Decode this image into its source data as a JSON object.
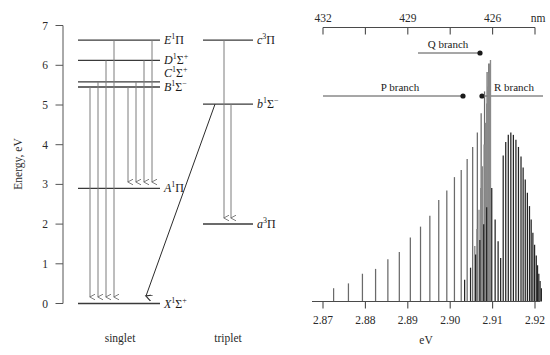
{
  "figure": {
    "type": "two-panel-scientific-figure"
  },
  "left_panel": {
    "name": "energy-level-diagram",
    "y_axis": {
      "label": "Energy, eV",
      "ticks": [
        "0",
        "1",
        "2",
        "3",
        "4",
        "5",
        "6",
        "7"
      ],
      "min": 0,
      "max": 7,
      "unit": "eV"
    },
    "column_captions": [
      "singlet",
      "triplet"
    ],
    "levels": [
      {
        "id": "X",
        "letter": "X",
        "multiplicity": "1",
        "term": "Σ",
        "charge": "+",
        "energy": 0.0,
        "column": "singlet"
      },
      {
        "id": "A",
        "letter": "A",
        "multiplicity": "1",
        "term": "Π",
        "charge": "",
        "energy": 2.9,
        "column": "singlet"
      },
      {
        "id": "B",
        "letter": "B",
        "multiplicity": "1",
        "term": "Σ",
        "charge": "−",
        "energy": 5.45,
        "column": "singlet"
      },
      {
        "id": "C",
        "letter": "C",
        "multiplicity": "1",
        "term": "Σ",
        "charge": "+",
        "energy": 5.58,
        "column": "singlet"
      },
      {
        "id": "D",
        "letter": "D",
        "multiplicity": "1",
        "term": "Σ",
        "charge": "+",
        "energy": 6.12,
        "column": "singlet"
      },
      {
        "id": "E",
        "letter": "E",
        "multiplicity": "1",
        "term": "Π",
        "charge": "",
        "energy": 6.63,
        "column": "singlet"
      },
      {
        "id": "a",
        "letter": "a",
        "multiplicity": "3",
        "term": "Π",
        "charge": "",
        "energy": 2.03,
        "column": "triplet"
      },
      {
        "id": "b",
        "letter": "b",
        "multiplicity": "1",
        "term": "Σ",
        "charge": "−",
        "energy": 5.02,
        "column": "triplet"
      },
      {
        "id": "c",
        "letter": "c",
        "multiplicity": "3",
        "term": "Π",
        "charge": "",
        "energy": 6.63,
        "column": "triplet"
      }
    ],
    "transitions": [
      {
        "from": "E",
        "to": "X",
        "kind": "vertical"
      },
      {
        "from": "D",
        "to": "X",
        "kind": "vertical"
      },
      {
        "from": "C",
        "to": "X",
        "kind": "vertical"
      },
      {
        "from": "B",
        "to": "X",
        "kind": "vertical"
      },
      {
        "from": "E",
        "to": "A",
        "kind": "vertical"
      },
      {
        "from": "D",
        "to": "A",
        "kind": "vertical"
      },
      {
        "from": "C",
        "to": "A",
        "kind": "vertical"
      },
      {
        "from": "B",
        "to": "A",
        "kind": "vertical"
      },
      {
        "from": "c",
        "to": "a",
        "kind": "vertical"
      },
      {
        "from": "b",
        "to": "a",
        "kind": "vertical"
      },
      {
        "from": "b",
        "to": "X",
        "kind": "diagonal-intercombination"
      }
    ]
  },
  "right_panel": {
    "name": "rotational-spectrum",
    "top_axis": {
      "label": "nm",
      "tick_labels": [
        "432",
        "",
        "429",
        "",
        "426",
        ""
      ],
      "values": [
        432,
        430.5,
        429,
        427.5,
        426,
        424.5
      ]
    },
    "bottom_axis": {
      "label": "eV",
      "tick_labels": [
        "2.87",
        "2.88",
        "2.89",
        "2.90",
        "2.91",
        "2.92"
      ],
      "min": 2.865,
      "max": 2.9265
    },
    "annotations": [
      {
        "id": "q-branch",
        "label": "Q branch"
      },
      {
        "id": "p-branch",
        "label": "P branch"
      },
      {
        "id": "r-branch",
        "label": "R branch"
      }
    ]
  },
  "chart_data": {
    "type": "bar",
    "title": "",
    "xlabel": "eV",
    "ylabel": "",
    "xlim": [
      2.865,
      2.9265
    ],
    "ylim": [
      0,
      1
    ],
    "grid": false,
    "secondary_xaxis": {
      "label": "nm",
      "ticks": [
        432,
        429,
        426
      ]
    },
    "legend_position": "inline-annotations",
    "series": [
      {
        "name": "P branch",
        "x": [
          2.8725,
          2.876,
          2.8793,
          2.8824,
          2.8853,
          2.888,
          2.8906,
          2.893,
          2.8952,
          2.8973,
          2.8992,
          2.901,
          2.9026,
          2.904,
          2.9053,
          2.9064,
          2.9073,
          2.9081,
          2.9087,
          2.9091
        ],
        "values": [
          0.055,
          0.075,
          0.115,
          0.135,
          0.175,
          0.205,
          0.265,
          0.31,
          0.355,
          0.42,
          0.46,
          0.515,
          0.545,
          0.59,
          0.64,
          0.7,
          0.78,
          0.87,
          0.95,
          0.985
        ]
      },
      {
        "name": "Q branch",
        "x": [
          2.9058,
          2.9063,
          2.9068,
          2.9072,
          2.9076,
          2.908,
          2.9083,
          2.9086,
          2.9089,
          2.9091,
          2.9093,
          2.9095
        ],
        "values": [
          0.23,
          0.3,
          0.38,
          0.47,
          0.56,
          0.65,
          0.74,
          0.82,
          0.89,
          0.945,
          0.985,
          1.0
        ]
      },
      {
        "name": "R branch",
        "x": [
          2.9034,
          2.9048,
          2.906,
          2.907,
          2.9079,
          2.9086,
          2.9098,
          2.9106,
          2.9113,
          2.9119,
          2.9125,
          2.9131,
          2.9137,
          2.9143,
          2.9149,
          2.9155,
          2.9161,
          2.9167,
          2.9172,
          2.9177,
          2.9182,
          2.9187,
          2.9191,
          2.9195,
          2.9199,
          2.9203,
          2.9206,
          2.9209,
          2.9212,
          2.9215
        ],
        "values": [
          0.09,
          0.14,
          0.195,
          0.255,
          0.32,
          0.39,
          0.47,
          0.34,
          0.25,
          0.18,
          0.605,
          0.66,
          0.69,
          0.7,
          0.69,
          0.67,
          0.64,
          0.6,
          0.555,
          0.505,
          0.45,
          0.395,
          0.34,
          0.285,
          0.235,
          0.19,
          0.15,
          0.115,
          0.085,
          0.055
        ]
      }
    ]
  }
}
